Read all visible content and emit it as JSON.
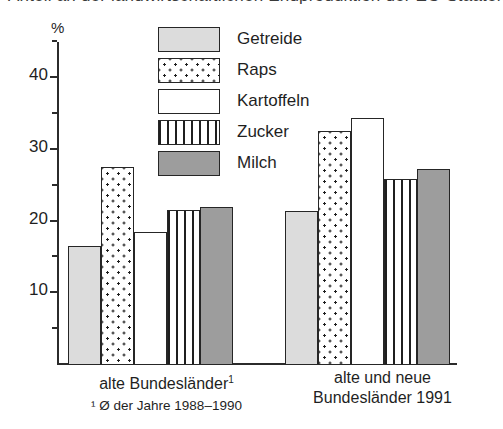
{
  "title_clipped": "Anteil an der landwirtschaftlichen Endproduktion der EG-Staaten (%)",
  "axis": {
    "unit_symbol": "%",
    "y_ticks_major": [
      "40",
      "30",
      "20",
      "10"
    ],
    "y_max": 45
  },
  "legend": {
    "items": [
      {
        "label": "Getreide",
        "pattern": "solid-light"
      },
      {
        "label": "Raps",
        "pattern": "dots"
      },
      {
        "label": "Kartoffeln",
        "pattern": "white"
      },
      {
        "label": "Zucker",
        "pattern": "vertical-stripes"
      },
      {
        "label": "Milch",
        "pattern": "solid-mid"
      }
    ]
  },
  "groups": [
    {
      "caption_line1": "alte Bundesländer",
      "caption_marker": "1",
      "footnote": "¹ Ø der Jahre 1988–1990"
    },
    {
      "caption_line1": "alte und neue",
      "caption_line2": "Bundesländer 1991"
    }
  ],
  "chart_data": {
    "type": "bar",
    "title": "Anteil an der landwirtschaftlichen Endproduktion der EG-Staaten (%)",
    "xlabel": "",
    "ylabel": "%",
    "ylim": [
      0,
      45
    ],
    "grid": false,
    "legend_position": "top-center",
    "categories": [
      "alte Bundesländer",
      "alte und neue Bundesländer 1991"
    ],
    "series": [
      {
        "name": "Getreide",
        "values": [
          16.6,
          21.5
        ]
      },
      {
        "name": "Raps",
        "values": [
          27.6,
          32.6
        ]
      },
      {
        "name": "Kartoffeln",
        "values": [
          18.5,
          34.4
        ]
      },
      {
        "name": "Zucker",
        "values": [
          21.6,
          26.0
        ]
      },
      {
        "name": "Milch",
        "values": [
          22.1,
          27.3
        ]
      }
    ],
    "annotations": [
      "¹ Ø der Jahre 1988–1990"
    ]
  }
}
